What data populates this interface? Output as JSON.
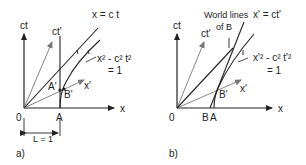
{
  "panel_a": {
    "caption": "a)",
    "axis_ct": "ct",
    "axis_x": "x",
    "axis_ctp": "ct'",
    "axis_xp": "x'",
    "light_line": "x = c t",
    "hyperbola_line1": "x² - c² t²",
    "hyperbola_line2": "= 1",
    "origin": "0",
    "point_A": "A",
    "point_Ap": "A'",
    "point_Bp": "B'",
    "length_label": "L = 1"
  },
  "panel_b": {
    "caption": "b)",
    "axis_ct": "ct",
    "axis_x": "x",
    "axis_ctp": "ct'",
    "axis_xp": "x'",
    "light_line": "x' = ct'",
    "world_lines_line1": "World lines",
    "world_lines_line2": "of B",
    "hyperbola_line1": "x'² - c² t'²",
    "hyperbola_line2": "= 1",
    "origin": "0",
    "point_B": "B",
    "point_A": "A",
    "point_Bp": "B'"
  },
  "colors": {
    "line": "#222222",
    "light_grey": "#888888"
  }
}
